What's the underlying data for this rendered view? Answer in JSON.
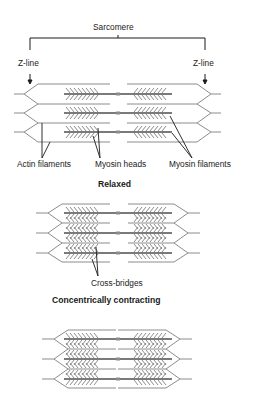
{
  "figure": {
    "top_label": "Sarcomere",
    "z_line_left": "Z-line",
    "z_line_right": "Z-line",
    "relaxed": {
      "title": "Relaxed",
      "labels": {
        "actin": "Actin filaments",
        "myosin_heads": "Myosin heads",
        "myosin_filaments": "Myosin filaments"
      }
    },
    "concentric": {
      "title": "Concentrically contracting",
      "labels": {
        "cross_bridges": "Cross-bridges"
      }
    },
    "third_state": {
      "title": ""
    }
  },
  "colors": {
    "filament": "#8c8c8c",
    "thick": "#7a7a7a",
    "pointer": "#1a1a1a",
    "text": "#1a1a1a"
  }
}
